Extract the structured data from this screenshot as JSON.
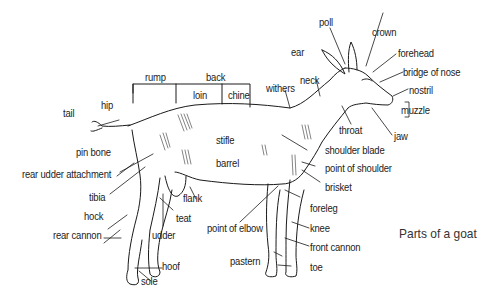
{
  "diagram": {
    "title": "Parts of a goat",
    "labels": {
      "poll": "poll",
      "crown": "crown",
      "ear": "ear",
      "forehead": "forehead",
      "bridge_of_nose": "bridge of nose",
      "nostril": "nostril",
      "muzzle": "muzzle",
      "jaw": "jaw",
      "throat": "throat",
      "neck": "neck",
      "withers": "withers",
      "back": "back",
      "rump": "rump",
      "loin": "loin",
      "chine": "chine",
      "hip": "hip",
      "tail": "tail",
      "pin_bone": "pin bone",
      "rear_udder_attachment": "rear udder attachment",
      "tibia": "tibia",
      "hock": "hock",
      "rear_cannon": "rear cannon",
      "udder": "udder",
      "teat": "teat",
      "flank": "flank",
      "hoof": "hoof",
      "sole": "sole",
      "stifle": "stifle",
      "barrel": "barrel",
      "shoulder_blade": "shoulder blade",
      "point_of_shoulder": "point of shoulder",
      "brisket": "brisket",
      "foreleg": "foreleg",
      "knee": "knee",
      "front_cannon": "front cannon",
      "toe": "toe",
      "pastern": "pastern",
      "point_of_elbow": "point of elbow"
    }
  }
}
